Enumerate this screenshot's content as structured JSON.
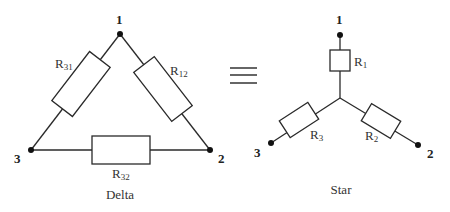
{
  "delta": {
    "caption": "Delta",
    "nodes": [
      {
        "label": "1"
      },
      {
        "label": "2"
      },
      {
        "label": "3"
      }
    ],
    "resistors": [
      {
        "label": "R",
        "sub": "31"
      },
      {
        "label": "R",
        "sub": "12"
      },
      {
        "label": "R",
        "sub": "32"
      }
    ]
  },
  "equivalence_symbol": "≡",
  "star": {
    "caption": "Star",
    "nodes": [
      {
        "label": "1"
      },
      {
        "label": "2"
      },
      {
        "label": "3"
      }
    ],
    "resistors": [
      {
        "label": "R",
        "sub": "1"
      },
      {
        "label": "R",
        "sub": "2"
      },
      {
        "label": "R",
        "sub": "3"
      }
    ]
  }
}
